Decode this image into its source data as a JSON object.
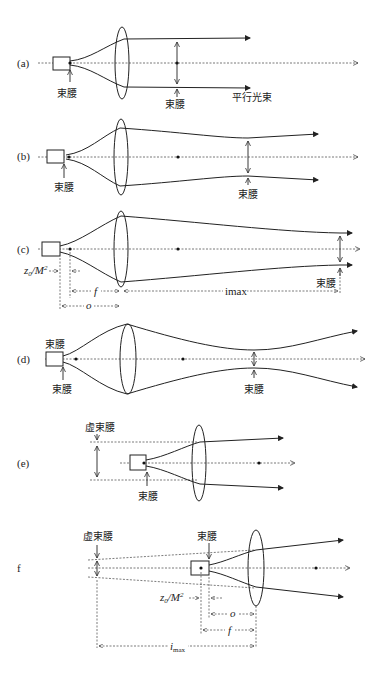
{
  "figure": {
    "panels": [
      {
        "id": "a",
        "label": "(a)",
        "annotations": [
          "束腰",
          "束腰",
          "平行光束"
        ]
      },
      {
        "id": "b",
        "label": "(b)",
        "annotations": [
          "束腰",
          "束腰"
        ]
      },
      {
        "id": "c",
        "label": "(c)",
        "annotations": [
          "束腰"
        ],
        "dimensions": [
          "z₀/M²",
          "f",
          "o",
          "imax"
        ]
      },
      {
        "id": "d",
        "label": "(d)",
        "annotations": [
          "束腰",
          "束腰",
          "束腰"
        ]
      },
      {
        "id": "e",
        "label": "(e)",
        "annotations": [
          "虚束腰",
          "束腰"
        ]
      },
      {
        "id": "f",
        "label": "(f)",
        "annotations": [
          "虚束腰",
          "束腰"
        ],
        "dimensions": [
          "z₀/M²",
          "o",
          "f",
          "imax"
        ]
      }
    ]
  },
  "labels": {
    "a": "(a)",
    "b": "(b)",
    "c": "(c)",
    "d": "(d)",
    "e": "(e)",
    "f": "f",
    "waist": "束腰",
    "virtual_waist": "虚束腰",
    "parallel_beam": "平行光束",
    "z0": "z",
    "z0_sub": "0",
    "z0_rest": "/M",
    "z0_sup": "2",
    "o": "o",
    "imax_c": "imax",
    "imax_f": "i",
    "imax_f_sub": "max"
  }
}
